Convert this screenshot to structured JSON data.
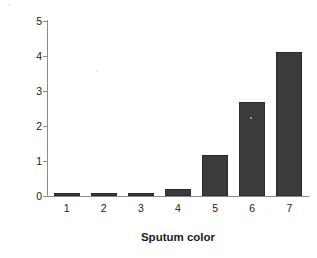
{
  "chart_data": {
    "type": "bar",
    "title": "",
    "subtitle": "",
    "xlabel": "Sputum color",
    "ylabel": "NE activity",
    "categories": [
      "1",
      "2",
      "3",
      "4",
      "5",
      "6",
      "7"
    ],
    "values": [
      0.05,
      0.04,
      0.04,
      0.19,
      1.17,
      2.7,
      4.12
    ],
    "series": [
      {
        "name": "NE activity",
        "values": [
          0.05,
          0.04,
          0.04,
          0.19,
          1.17,
          2.7,
          4.12
        ]
      }
    ],
    "ylim": [
      0,
      5
    ],
    "yticks": [
      0,
      1,
      2,
      3,
      4,
      5
    ],
    "ytick_labels": [
      "0",
      "1",
      "2",
      "3",
      "4",
      "5"
    ],
    "xtick_labels": [
      "1",
      "2",
      "3",
      "4",
      "5",
      "6",
      "7"
    ],
    "grid": false,
    "legend": false,
    "legend_position": "none",
    "bar_color": "#3b3b3b",
    "axis_color": "#8c8c8c",
    "text_color": "#1a1a1a",
    "background_color": "#ffffff"
  }
}
